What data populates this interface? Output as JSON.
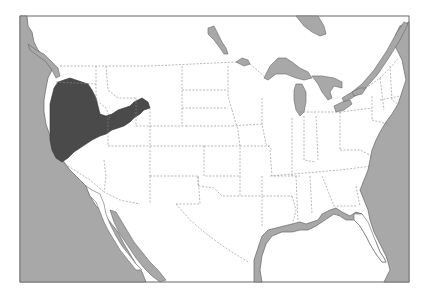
{
  "map": {
    "subject": "Contiguous United States",
    "highlighted_region": "Great Basin (western interior: Nevada, SE Oregon, SW Idaho, western Utah)",
    "colors": {
      "background": "#ffffff",
      "land": "#ffffff",
      "water": "#a8a8a8",
      "highlight": "#4a4a4a",
      "border": "#555555",
      "state_lines": "#8a8a8a",
      "frame": "#666666"
    },
    "features": [
      "ocean",
      "gulf-of-mexico",
      "gulf-of-california",
      "great-lakes",
      "lake-of-the-woods",
      "hudson-bay-tip",
      "state-boundaries",
      "highlighted-region"
    ]
  }
}
